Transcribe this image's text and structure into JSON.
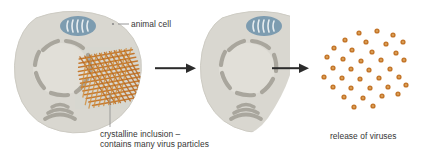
{
  "diagram": {
    "type": "biology-process-diagram",
    "background_color": "#ffffff",
    "stages": [
      {
        "id": "infected-cell",
        "name": "animal cell with crystalline inclusion",
        "label": "animal cell",
        "organelles": [
          "mitochondrion",
          "nuclear-envelope",
          "golgi-apparatus",
          "crystalline-inclusion"
        ]
      },
      {
        "id": "lysing-cell",
        "name": "cell rupturing, inclusion gone",
        "label": "",
        "organelles": [
          "mitochondrion",
          "nuclear-envelope",
          "golgi-apparatus"
        ]
      },
      {
        "id": "free-viruses",
        "name": "scattered virus particles",
        "label": "release of viruses",
        "particle_count": 36
      }
    ],
    "labels": {
      "animal_cell": "animal cell",
      "crystalline_line1": "crystalline inclusion –",
      "crystalline_line2": "contains many virus particles",
      "release_of_viruses": "release of viruses"
    },
    "arrows": [
      {
        "id": "arrow-1",
        "from": "infected-cell",
        "to": "lysing-cell",
        "direction": "right"
      },
      {
        "id": "arrow-2",
        "from": "lysing-cell",
        "to": "free-viruses",
        "direction": "right"
      }
    ],
    "colors": {
      "cytoplasm": "#d9d7d0",
      "cytoplasm_edge": "#c9c7bf",
      "nucleus_fill": "#e0ded7",
      "organelle_grey": "#a8a59c",
      "mitochondrion_fill": "#7d9cb0",
      "mitochondrion_cristae": "#e6ecef",
      "virus_orange": "#c4762a",
      "virus_orange_light": "#d9933f",
      "arrow": "#2b2b2b",
      "text": "#363636",
      "leader_line": "#8a8a8a"
    }
  }
}
